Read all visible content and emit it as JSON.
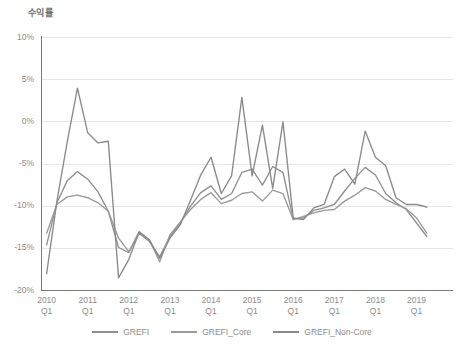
{
  "chart_data": {
    "type": "line",
    "title": "수익률",
    "xlabel": "",
    "ylabel": "",
    "ylim": [
      -20,
      10
    ],
    "grid": true,
    "legend_position": "bottom",
    "ytick_labels": [
      "10%",
      "5%",
      "0%",
      "-5%",
      "-10%",
      "-15%",
      "-20%"
    ],
    "ytick_values": [
      10,
      5,
      0,
      -5,
      -10,
      -15,
      -20
    ],
    "xtick_labels": [
      {
        "year": "2010",
        "quarter": "Q1"
      },
      {
        "year": "2011",
        "quarter": "Q1"
      },
      {
        "year": "2012",
        "quarter": "Q1"
      },
      {
        "year": "2013",
        "quarter": "Q1"
      },
      {
        "year": "2014",
        "quarter": "Q1"
      },
      {
        "year": "2015",
        "quarter": "Q1"
      },
      {
        "year": "2016",
        "quarter": "Q1"
      },
      {
        "year": "2017",
        "quarter": "Q1"
      },
      {
        "year": "2018",
        "quarter": "Q1"
      },
      {
        "year": "2019",
        "quarter": "Q1"
      }
    ],
    "x": [
      "2010 Q1",
      "2010 Q2",
      "2010 Q3",
      "2010 Q4",
      "2011 Q1",
      "2011 Q2",
      "2011 Q3",
      "2011 Q4",
      "2012 Q1",
      "2012 Q2",
      "2012 Q3",
      "2012 Q4",
      "2013 Q1",
      "2013 Q2",
      "2013 Q3",
      "2013 Q4",
      "2014 Q1",
      "2014 Q2",
      "2014 Q3",
      "2014 Q4",
      "2015 Q1",
      "2015 Q2",
      "2015 Q3",
      "2015 Q4",
      "2016 Q1",
      "2016 Q2",
      "2016 Q3",
      "2016 Q4",
      "2017 Q1",
      "2017 Q2",
      "2017 Q3",
      "2017 Q4",
      "2018 Q1",
      "2018 Q2",
      "2018 Q3",
      "2018 Q4",
      "2019 Q1",
      "2019 Q2"
    ],
    "series": [
      {
        "name": "GREFI",
        "color": "#8f8f8f",
        "values": [
          -14.6,
          -9.6,
          -7.0,
          -5.9,
          -6.8,
          -8.3,
          -10.6,
          -14.9,
          -15.5,
          -13.2,
          -14.2,
          -16.0,
          -13.6,
          -12.0,
          -10.0,
          -8.4,
          -7.6,
          -9.2,
          -8.5,
          -6.0,
          -5.6,
          -7.5,
          -5.3,
          -6.0,
          -11.5,
          -11.4,
          -10.5,
          -10.2,
          -9.8,
          -8.2,
          -6.7,
          -5.4,
          -6.3,
          -8.5,
          -9.6,
          -10.4,
          -12.0,
          -13.6
        ]
      },
      {
        "name": "GREFI_Core",
        "color": "#9a9a9a",
        "values": [
          -13.2,
          -9.8,
          -8.9,
          -8.7,
          -9.0,
          -9.6,
          -10.6,
          -13.8,
          -15.4,
          -13.0,
          -14.0,
          -16.6,
          -13.4,
          -11.9,
          -10.4,
          -9.2,
          -8.4,
          -9.7,
          -9.3,
          -8.5,
          -8.3,
          -9.4,
          -8.1,
          -8.5,
          -11.6,
          -11.2,
          -10.8,
          -10.5,
          -10.4,
          -9.4,
          -8.7,
          -7.8,
          -8.2,
          -9.2,
          -9.8,
          -10.3,
          -11.4,
          -13.2
        ]
      },
      {
        "name": "GREFI_Non-Core",
        "color": "#8a8a8a",
        "values": [
          -18.0,
          -9.4,
          -2.4,
          4.0,
          -1.3,
          -2.5,
          -2.3,
          -18.5,
          -16.3,
          -13.1,
          -14.0,
          -16.2,
          -13.8,
          -12.2,
          -9.3,
          -6.3,
          -4.2,
          -8.5,
          -6.4,
          2.9,
          -6.4,
          -0.4,
          -7.9,
          0.0,
          -11.4,
          -11.6,
          -10.2,
          -9.8,
          -6.5,
          -5.6,
          -7.4,
          -1.1,
          -4.2,
          -5.2,
          -9.0,
          -9.8,
          -9.8,
          -10.1
        ]
      }
    ]
  },
  "legend": {
    "items": [
      {
        "label": "GREFI"
      },
      {
        "label": "GREFI_Core"
      },
      {
        "label": "GREFI_Non-Core"
      }
    ]
  }
}
